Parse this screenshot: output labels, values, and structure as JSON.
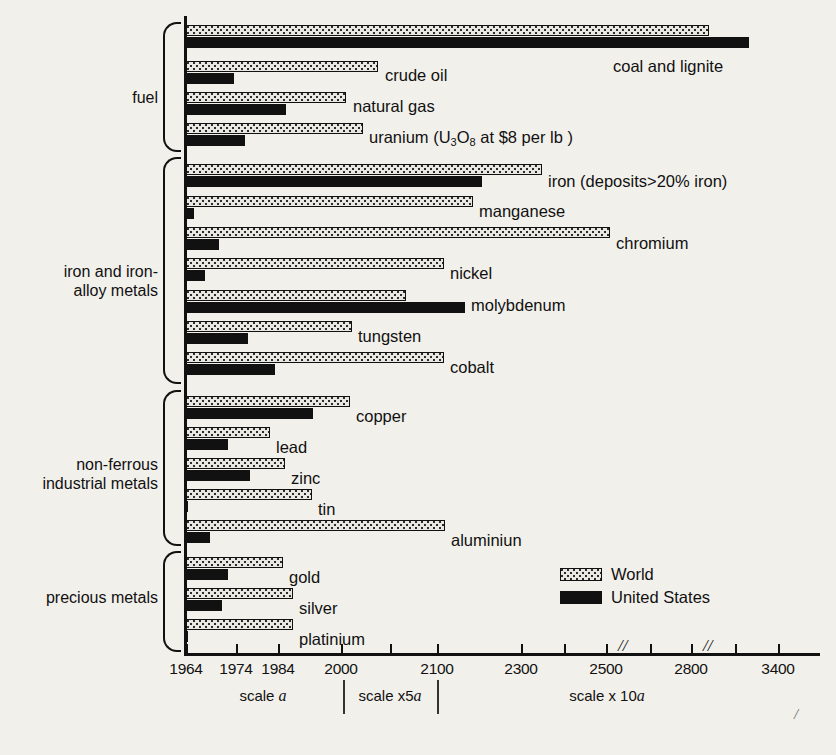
{
  "chart_data": {
    "type": "bar",
    "title": "",
    "orientation": "horizontal",
    "xlabel": "",
    "ylabel": "",
    "axis": {
      "tick_labels": [
        "1964",
        "1974",
        "1984",
        "2000",
        "2100",
        "2300",
        "2500",
        "2800",
        "3400"
      ],
      "tick_px": [
        186,
        236,
        278,
        341,
        437,
        521,
        606,
        691,
        778
      ],
      "minor_tick_px": [
        390,
        564,
        650,
        735
      ],
      "break_marks_px": [
        618,
        703
      ],
      "scale_divider_px": [
        343,
        437
      ],
      "scale_labels": [
        {
          "text_prefix": "scale ",
          "text_italic": "a",
          "center_px": 263
        },
        {
          "text_prefix": "scale x5",
          "text_italic": "a",
          "center_px": 390
        },
        {
          "text_prefix": "scale x 10",
          "text_italic": "a",
          "center_px": 607
        }
      ]
    },
    "legend": {
      "position": "bottom-right",
      "entries": [
        {
          "name": "World",
          "pattern": "stippled",
          "color": "#e9e7e2"
        },
        {
          "name": "United States",
          "pattern": "solid",
          "color": "#111111"
        }
      ]
    },
    "groups": [
      {
        "name": "fuel",
        "label": "fuel",
        "label_top": 88,
        "brace_top": 22,
        "brace_height": 126,
        "items": [
          {
            "label": "coal and lignite",
            "label_x": 613,
            "label_y": 57,
            "world_year": 2865,
            "us_year": 3155,
            "world_px": 709,
            "us_px": 749,
            "world_top": 25,
            "us_top": 37
          },
          {
            "label": "crude oil",
            "label_x": 385,
            "label_y": 66,
            "world_year": 2048,
            "us_year": 1971,
            "world_px": 378,
            "us_px": 234,
            "world_top": 61,
            "us_top": 73
          },
          {
            "label": "natural gas",
            "label_x": 353,
            "label_y": 97,
            "world_year": 2006,
            "us_year": 1985,
            "world_px": 346,
            "us_px": 286,
            "world_top": 92,
            "us_top": 104
          },
          {
            "label": "uranium (U3O8 at $8 per lb )",
            "label_x": 369,
            "label_y": 128,
            "label_html": "uranium (U<sub>3</sub>O<sub>8</sub> at $8 per lb )",
            "world_year": 2025,
            "us_year": 1976,
            "world_px": 363,
            "us_px": 245,
            "world_top": 123,
            "us_top": 135
          }
        ]
      },
      {
        "name": "iron and iron-alloy metals",
        "label": "iron and iron-\nalloy metals",
        "label_top": 262,
        "brace_top": 157,
        "brace_height": 223,
        "items": [
          {
            "label": "iron (deposits>20% iron)",
            "label_x": 548,
            "label_y": 172,
            "world_year": 2356,
            "us_year": 2197,
            "world_px": 542,
            "us_px": 482,
            "world_top": 164,
            "us_top": 176
          },
          {
            "label": "manganese",
            "label_x": 479,
            "label_y": 202,
            "world_year": 2195,
            "us_year": 1966,
            "world_px": 473,
            "us_px": 194,
            "world_top": 196,
            "us_top": 208
          },
          {
            "label": "chromium",
            "label_x": 616,
            "label_y": 234,
            "world_year": 2501,
            "us_year": 1971,
            "world_px": 610,
            "us_px": 219,
            "world_top": 227,
            "us_top": 239
          },
          {
            "label": "nickel",
            "label_x": 450,
            "label_y": 264,
            "world_year": 2126,
            "us_year": 1968,
            "world_px": 444,
            "us_px": 205,
            "world_top": 258,
            "us_top": 270
          },
          {
            "label": "molybdenum",
            "label_x": 471,
            "label_y": 296,
            "world_year": 2059,
            "us_year": 2185,
            "world_px": 406,
            "us_px": 465,
            "world_top": 290,
            "us_top": 302
          },
          {
            "label": "tungsten",
            "label_x": 358,
            "label_y": 327,
            "world_year": 2010,
            "us_year": 1978,
            "world_px": 352,
            "us_px": 248,
            "world_top": 321,
            "us_top": 333
          },
          {
            "label": "cobalt",
            "label_x": 450,
            "label_y": 358,
            "world_year": 2126,
            "us_year": 1983,
            "world_px": 444,
            "us_px": 275,
            "world_top": 352,
            "us_top": 364
          }
        ]
      },
      {
        "name": "non-ferrous industrial metals",
        "label": "non-ferrous\nindustrial metals",
        "label_top": 455,
        "brace_top": 390,
        "brace_height": 152,
        "items": [
          {
            "label": "copper",
            "label_x": 356,
            "label_y": 407,
            "world_year": 2007,
            "us_year": 1998,
            "world_px": 350,
            "us_px": 313,
            "world_top": 396,
            "us_top": 408
          },
          {
            "label": "lead",
            "label_x": 276,
            "label_y": 438,
            "world_year": 1984,
            "us_year": 1974,
            "world_px": 270,
            "us_px": 228,
            "world_top": 427,
            "us_top": 439
          },
          {
            "label": "zinc",
            "label_x": 291,
            "label_y": 469,
            "world_year": 1988,
            "us_year": 1977,
            "world_px": 285,
            "us_px": 250,
            "world_top": 458,
            "us_top": 470
          },
          {
            "label": "tin",
            "label_x": 318,
            "label_y": 500,
            "world_year": 1997,
            "us_year": 1964,
            "world_px": 312,
            "us_px": 186,
            "world_top": 489,
            "us_top": 501
          },
          {
            "label": "aluminiun",
            "label_x": 451,
            "label_y": 531,
            "world_year": 2130,
            "us_year": 1969,
            "world_px": 445,
            "us_px": 210,
            "world_top": 520,
            "us_top": 532
          }
        ]
      },
      {
        "name": "precious metals",
        "label": "precious metals",
        "label_top": 588,
        "brace_top": 551,
        "brace_height": 97,
        "items": [
          {
            "label": "gold",
            "label_x": 289,
            "label_y": 568,
            "world_year": 1987,
            "us_year": 1974,
            "world_px": 283,
            "us_px": 228,
            "world_top": 557,
            "us_top": 569
          },
          {
            "label": "silver",
            "label_x": 299,
            "label_y": 599,
            "world_year": 1990,
            "us_year": 1973,
            "world_px": 293,
            "us_px": 222,
            "world_top": 588,
            "us_top": 600
          },
          {
            "label": "platinium",
            "label_x": 299,
            "label_y": 630,
            "world_year": 1990,
            "us_year": 1964,
            "world_px": 293,
            "us_px": 186,
            "world_top": 619,
            "us_top": 631
          }
        ]
      }
    ]
  },
  "stray_mark": "/"
}
